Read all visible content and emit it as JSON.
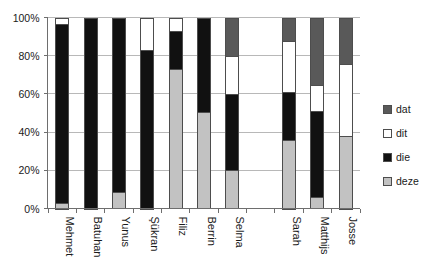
{
  "chart_data": {
    "type": "bar",
    "subtype": "stacked-100-percent",
    "title": "",
    "xlabel": "",
    "ylabel": "",
    "ylim": [
      0,
      100
    ],
    "ytick_labels": [
      "0%",
      "20%",
      "40%",
      "60%",
      "80%",
      "100%"
    ],
    "ytick_values": [
      0,
      20,
      40,
      60,
      80,
      100
    ],
    "grid": true,
    "legend_position": "right",
    "categories": [
      "Mehmet",
      "Batuhan",
      "Yunus",
      "Şükran",
      "Filiz",
      "Berrin",
      "Selma",
      "",
      "Sarah",
      "Matthijs",
      "Josse"
    ],
    "stack_order_bottom_to_top": [
      "deze",
      "die",
      "dit",
      "dat"
    ],
    "series": [
      {
        "name": "dat",
        "color": "#595959",
        "values": [
          0,
          0,
          0,
          0,
          0,
          0,
          20,
          0,
          12,
          35,
          24
        ]
      },
      {
        "name": "dit",
        "color": "#ffffff",
        "values": [
          3,
          0,
          0,
          17,
          7,
          0,
          20,
          0,
          27,
          14,
          38
        ]
      },
      {
        "name": "die",
        "color": "#111111",
        "values": [
          94,
          100,
          91,
          83,
          20,
          49,
          40,
          0,
          25,
          45,
          0
        ]
      },
      {
        "name": "deze",
        "color": "#c2c2c2",
        "values": [
          3,
          0,
          9,
          0,
          73,
          51,
          20,
          0,
          36,
          6,
          38
        ]
      }
    ]
  },
  "legend": {
    "items": [
      {
        "label": "dat",
        "color": "#595959"
      },
      {
        "label": "dit",
        "color": "#ffffff"
      },
      {
        "label": "die",
        "color": "#111111"
      },
      {
        "label": "deze",
        "color": "#c2c2c2"
      }
    ]
  },
  "colors": {
    "dat": "#595959",
    "dit": "#ffffff",
    "die": "#111111",
    "deze": "#c2c2c2",
    "axis": "#6e6e6e",
    "grid": "#b8b8b8",
    "text": "#1a1a1a",
    "background": "#ffffff"
  }
}
